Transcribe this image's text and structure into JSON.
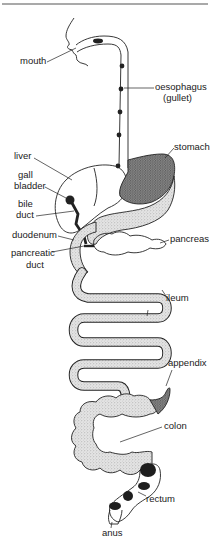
{
  "colors": {
    "ink": "#1a1a1a",
    "stipple_light": "#d6d6d6",
    "stipple_dark": "#7a7a7a",
    "band": "#1e1e1e",
    "rule": "#555555",
    "background": "#ffffff"
  },
  "labels": {
    "mouth": "mouth",
    "oesophagus": "oesophagus",
    "gullet": "(gullet)",
    "stomach": "stomach",
    "liver": "liver",
    "gall_bladder_1": "gall",
    "gall_bladder_2": "bladder",
    "bile_duct_1": "bile",
    "bile_duct_2": "duct",
    "duodenum": "duodenum",
    "pancreas": "pancreas",
    "pancreatic_duct_1": "pancreatic",
    "pancreatic_duct_2": "duct",
    "ileum": "ileum",
    "appendix": "appendix",
    "colon": "colon",
    "rectum": "rectum",
    "anus": "anus"
  }
}
